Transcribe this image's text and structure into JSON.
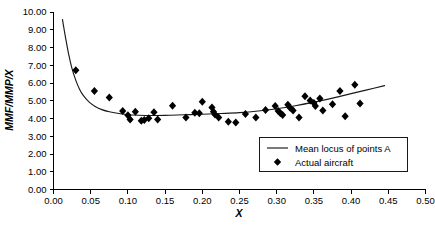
{
  "chart_data": {
    "type": "scatter",
    "title": "",
    "xlabel": "X",
    "ylabel": "MMF/MMP/X",
    "xlim": [
      0.0,
      0.5
    ],
    "ylim": [
      0.0,
      10.0
    ],
    "grid": false,
    "legend_position": "inside-right-lower",
    "x_ticks": [
      "0.00",
      "0.05",
      "0.10",
      "0.15",
      "0.20",
      "0.25",
      "0.30",
      "0.35",
      "0.40",
      "0.45",
      "0.50"
    ],
    "x_tick_values": [
      0.0,
      0.05,
      0.1,
      0.15,
      0.2,
      0.25,
      0.3,
      0.35,
      0.4,
      0.45,
      0.5
    ],
    "y_ticks": [
      "0.00",
      "1.00",
      "2.00",
      "3.00",
      "4.00",
      "5.00",
      "6.00",
      "7.00",
      "8.00",
      "9.00",
      "10.00"
    ],
    "y_tick_values": [
      0,
      1,
      2,
      3,
      4,
      5,
      6,
      7,
      8,
      9,
      10
    ],
    "series": [
      {
        "name": "Mean locus of points A",
        "type": "line",
        "marker": "none",
        "color": "#1a1a1a",
        "points": [
          {
            "x": 0.012,
            "y": 9.58
          },
          {
            "x": 0.016,
            "y": 8.6
          },
          {
            "x": 0.02,
            "y": 7.7
          },
          {
            "x": 0.025,
            "y": 6.8
          },
          {
            "x": 0.03,
            "y": 6.15
          },
          {
            "x": 0.035,
            "y": 5.65
          },
          {
            "x": 0.04,
            "y": 5.3
          },
          {
            "x": 0.048,
            "y": 4.92
          },
          {
            "x": 0.056,
            "y": 4.68
          },
          {
            "x": 0.065,
            "y": 4.5
          },
          {
            "x": 0.075,
            "y": 4.38
          },
          {
            "x": 0.09,
            "y": 4.27
          },
          {
            "x": 0.105,
            "y": 4.2
          },
          {
            "x": 0.125,
            "y": 4.17
          },
          {
            "x": 0.15,
            "y": 4.18
          },
          {
            "x": 0.175,
            "y": 4.21
          },
          {
            "x": 0.2,
            "y": 4.24
          },
          {
            "x": 0.225,
            "y": 4.28
          },
          {
            "x": 0.25,
            "y": 4.33
          },
          {
            "x": 0.275,
            "y": 4.42
          },
          {
            "x": 0.3,
            "y": 4.55
          },
          {
            "x": 0.325,
            "y": 4.72
          },
          {
            "x": 0.35,
            "y": 4.92
          },
          {
            "x": 0.375,
            "y": 5.15
          },
          {
            "x": 0.4,
            "y": 5.4
          },
          {
            "x": 0.42,
            "y": 5.6
          },
          {
            "x": 0.445,
            "y": 5.85
          }
        ]
      },
      {
        "name": "Actual aircraft",
        "type": "scatter",
        "marker": "diamond",
        "color": "#000000",
        "points": [
          {
            "x": 0.03,
            "y": 6.72
          },
          {
            "x": 0.055,
            "y": 5.55
          },
          {
            "x": 0.075,
            "y": 5.18
          },
          {
            "x": 0.093,
            "y": 4.42
          },
          {
            "x": 0.1,
            "y": 4.18
          },
          {
            "x": 0.103,
            "y": 3.95
          },
          {
            "x": 0.11,
            "y": 4.38
          },
          {
            "x": 0.118,
            "y": 3.88
          },
          {
            "x": 0.122,
            "y": 3.92
          },
          {
            "x": 0.128,
            "y": 4.02
          },
          {
            "x": 0.135,
            "y": 4.35
          },
          {
            "x": 0.14,
            "y": 3.95
          },
          {
            "x": 0.16,
            "y": 4.72
          },
          {
            "x": 0.178,
            "y": 4.05
          },
          {
            "x": 0.19,
            "y": 4.32
          },
          {
            "x": 0.196,
            "y": 4.3
          },
          {
            "x": 0.2,
            "y": 4.95
          },
          {
            "x": 0.213,
            "y": 4.62
          },
          {
            "x": 0.215,
            "y": 4.38
          },
          {
            "x": 0.217,
            "y": 4.22
          },
          {
            "x": 0.222,
            "y": 4.05
          },
          {
            "x": 0.235,
            "y": 3.82
          },
          {
            "x": 0.245,
            "y": 3.78
          },
          {
            "x": 0.258,
            "y": 4.25
          },
          {
            "x": 0.272,
            "y": 4.05
          },
          {
            "x": 0.285,
            "y": 4.48
          },
          {
            "x": 0.298,
            "y": 4.7
          },
          {
            "x": 0.302,
            "y": 4.42
          },
          {
            "x": 0.305,
            "y": 4.3
          },
          {
            "x": 0.308,
            "y": 4.2
          },
          {
            "x": 0.315,
            "y": 4.78
          },
          {
            "x": 0.318,
            "y": 4.6
          },
          {
            "x": 0.322,
            "y": 4.45
          },
          {
            "x": 0.33,
            "y": 4.05
          },
          {
            "x": 0.338,
            "y": 5.25
          },
          {
            "x": 0.345,
            "y": 5.02
          },
          {
            "x": 0.35,
            "y": 4.88
          },
          {
            "x": 0.352,
            "y": 4.7
          },
          {
            "x": 0.358,
            "y": 5.12
          },
          {
            "x": 0.362,
            "y": 4.45
          },
          {
            "x": 0.375,
            "y": 4.8
          },
          {
            "x": 0.385,
            "y": 5.55
          },
          {
            "x": 0.392,
            "y": 4.12
          },
          {
            "x": 0.405,
            "y": 5.9
          },
          {
            "x": 0.412,
            "y": 4.85
          }
        ]
      }
    ],
    "legend_entries": [
      {
        "label": "Mean locus of points A",
        "marker": "line"
      },
      {
        "label": "Actual aircraft",
        "marker": "diamond"
      }
    ]
  },
  "axes": {
    "y_label": "MMF/MMP/X",
    "x_label": "X"
  }
}
